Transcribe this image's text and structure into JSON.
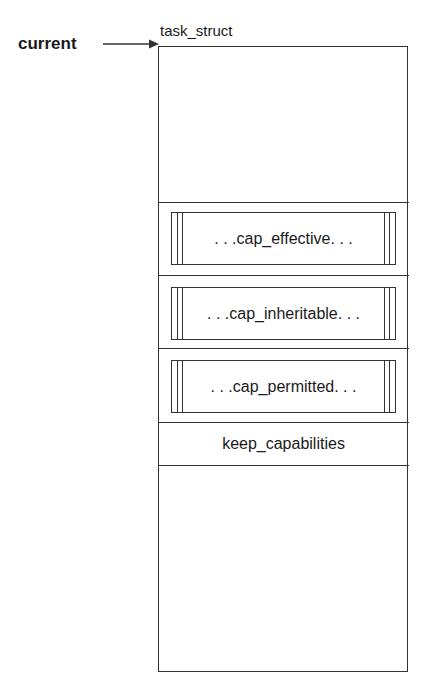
{
  "diagram": {
    "pointer_label": "current",
    "struct_title": "task_struct",
    "fields": [
      {
        "label": ". . .cap_effective. . .",
        "type": "capability-set"
      },
      {
        "label": ". . .cap_inheritable. . .",
        "type": "capability-set"
      },
      {
        "label": ". . .cap_permitted. . .",
        "type": "capability-set"
      },
      {
        "label": "keep_capabilities",
        "type": "flag"
      }
    ],
    "colors": {
      "line": "#333333",
      "text": "#1a1a1a",
      "background": "#ffffff"
    }
  }
}
